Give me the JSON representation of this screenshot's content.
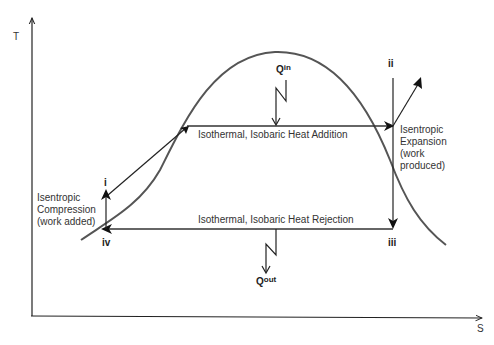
{
  "diagram": {
    "axes": {
      "y_label": "T",
      "x_label": "S"
    },
    "states": {
      "i": "i",
      "ii": "ii",
      "iii": "iii",
      "iv": "iv"
    },
    "processes": {
      "heat_addition": "Isothermal, Isobaric Heat Addition",
      "heat_rejection": "Isothermal, Isobaric Heat Rejection",
      "expansion": [
        "Isentropic",
        "Expansion",
        "(work",
        "produced)"
      ],
      "compression": [
        "Isentropic",
        "Compression",
        "(work added)"
      ]
    },
    "heat": {
      "q_in": {
        "base": "Q",
        "sup": "in"
      },
      "q_out": {
        "base": "Q",
        "sup": "out"
      }
    },
    "colors": {
      "curve": "#555555",
      "lines": "#222222",
      "text": "#333333"
    }
  }
}
